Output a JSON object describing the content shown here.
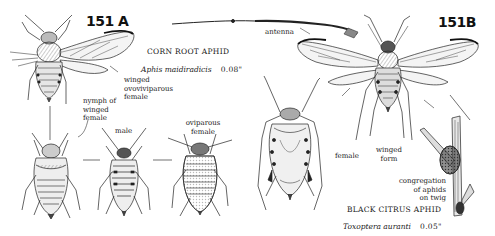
{
  "plate_a": {
    "number": "151 A",
    "common_name": "CORN ROOT APHID",
    "scientific_name": "Aphis maidiradicis",
    "size": "0.08\"",
    "labels": {
      "winged": [
        "winged",
        "ovoviviparous",
        "female"
      ],
      "nymph": [
        "nymph of",
        "winged",
        "female"
      ],
      "male": "male",
      "oviparous": [
        "oviparous",
        "female"
      ]
    }
  },
  "plate_b": {
    "number": "151B",
    "common_name": "BLACK CITRUS APHID",
    "scientific_name": "Toxoptera auranti",
    "size": "0.05\"",
    "labels": {
      "antenna": "antenna",
      "female": "female",
      "winged_form": [
        "winged",
        "form"
      ],
      "congregation": [
        "congregation",
        "of aphids",
        "on twig"
      ]
    }
  },
  "colors": {
    "ink": "#222222",
    "background": "#ffffff"
  }
}
